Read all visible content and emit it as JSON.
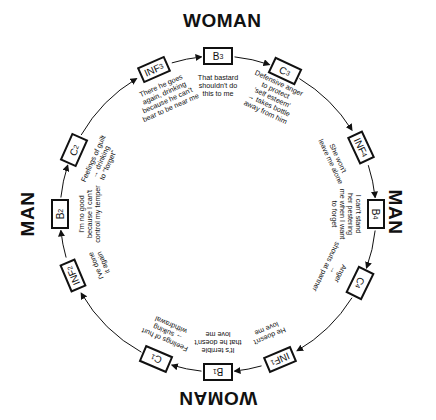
{
  "diagram": {
    "type": "cycle",
    "roles": {
      "top": "WOMAN",
      "right": "MAN",
      "bottom": "WOMAN",
      "left": "MAN"
    },
    "nodes": [
      {
        "id": "B3",
        "label": "B",
        "sub": "3",
        "caption": "That bastard\nshouldn't do\nthis to me"
      },
      {
        "id": "C3",
        "label": "C",
        "sub": "3",
        "caption": "Defensive anger\nto protect\n'self esteem'\n→ takes bottle\naway from him"
      },
      {
        "id": "INF4",
        "label": "INF",
        "sub": "4",
        "caption": "She won't\nleave me alone"
      },
      {
        "id": "B4",
        "label": "B",
        "sub": "4",
        "caption": "I can't stand\nher pestering\nme when I want\nto forget"
      },
      {
        "id": "C4",
        "label": "C",
        "sub": "4",
        "caption": "Anger\n→\nshouts at partner"
      },
      {
        "id": "INF1",
        "label": "INF",
        "sub": "1",
        "caption": "He doesn't\nlove me"
      },
      {
        "id": "B1",
        "label": "B",
        "sub": "1",
        "caption": "It's terrible\nthat he doesn't\nlove me"
      },
      {
        "id": "C1",
        "label": "C",
        "sub": "1",
        "caption": "Feelings of hurt\n→ sulking\nwithdrawal"
      },
      {
        "id": "INF2",
        "label": "INF",
        "sub": "2",
        "caption": "I've done\nit again"
      },
      {
        "id": "B2",
        "label": "B",
        "sub": "2",
        "caption": "I'm no good\nbecause I can't\ncontrol my temper"
      },
      {
        "id": "C2",
        "label": "C",
        "sub": "2",
        "caption": "Feelings of guilt\n→ drinking\nto \"forget\""
      },
      {
        "id": "INF3",
        "label": "INF",
        "sub": "3",
        "caption": "There he goes\nagain, drinking\nbecause he can't\nbear to be near me"
      }
    ],
    "colors": {
      "ink": "#111111",
      "background": "#ffffff"
    }
  }
}
